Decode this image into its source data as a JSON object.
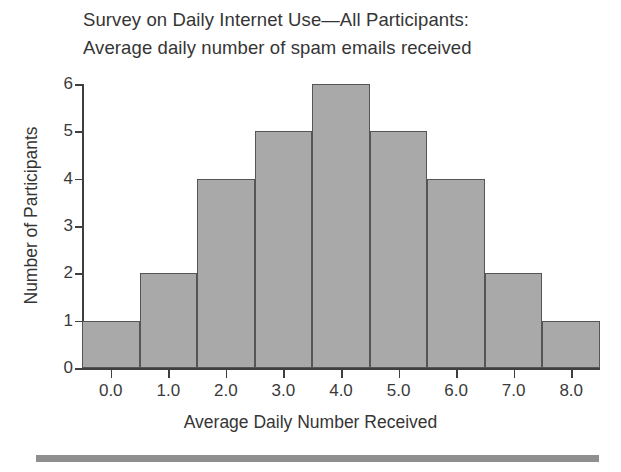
{
  "chart_data": {
    "type": "bar",
    "title": "Survey on Daily Internet Use—All Participants: Average daily number of spam emails received",
    "title_lines": [
      "Survey on Daily Internet Use—All Participants:",
      "Average daily number of spam emails received"
    ],
    "xlabel": "Average Daily Number Received",
    "ylabel": "Number of Participants",
    "categories": [
      "0.0",
      "1.0",
      "2.0",
      "3.0",
      "4.0",
      "5.0",
      "6.0",
      "7.0",
      "8.0"
    ],
    "x": [
      0,
      1,
      2,
      3,
      4,
      5,
      6,
      7,
      8
    ],
    "values": [
      1,
      2,
      4,
      5,
      6,
      5,
      4,
      2,
      1
    ],
    "xtick_labels": [
      "0.0",
      "1.0",
      "2.0",
      "3.0",
      "4.0",
      "5.0",
      "6.0",
      "7.0",
      "8.0"
    ],
    "ytick_labels": [
      "0",
      "1",
      "2",
      "3",
      "4",
      "5",
      "6"
    ],
    "ytick_values": [
      0,
      1,
      2,
      3,
      4,
      5,
      6
    ],
    "ylim": [
      0,
      6
    ],
    "xlim": [
      -0.5,
      8.5
    ],
    "grid": false,
    "legend": null,
    "bar_width": 1.0,
    "colors": {
      "bar_fill": "#a9a9a9",
      "bar_edge": "#555555",
      "axis": "#3f3f3f",
      "text": "#353535",
      "background": "#ffffff",
      "footer_rule": "#8f8f8f"
    }
  }
}
